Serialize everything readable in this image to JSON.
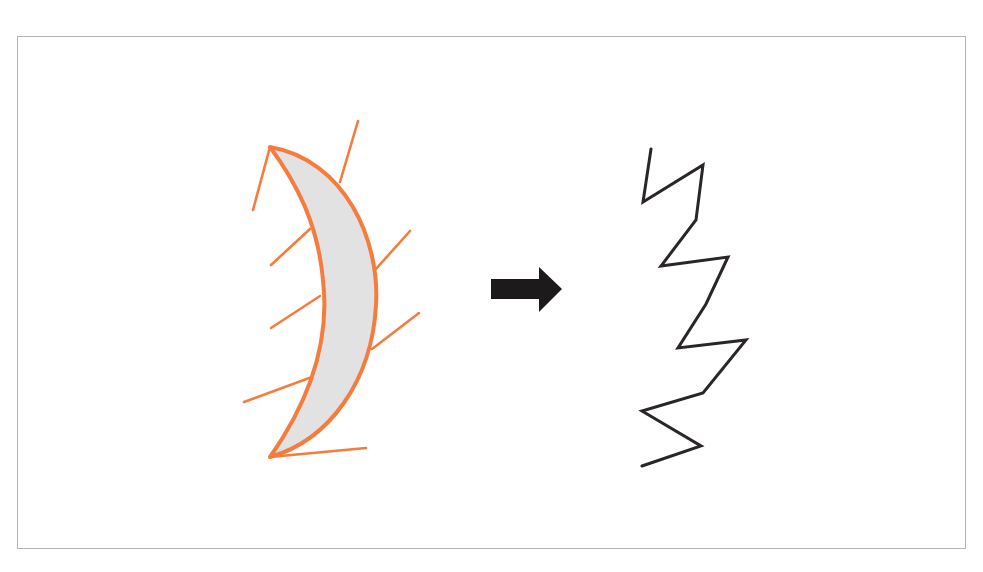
{
  "figure": {
    "colors": {
      "frame_border": "#b4b4b4",
      "crescent_fill": "#e2e2e2",
      "crescent_stroke": "#f47d3e",
      "rays": "#f47d3e",
      "arrow": "#1c1a1a",
      "zigzag": "#2a2626"
    },
    "left_shape": {
      "name": "crescent-with-rays",
      "ray_count": 7
    },
    "arrow": {
      "direction": "right"
    },
    "right_shape": {
      "name": "zigzag-line",
      "vertex_count": 13
    }
  }
}
